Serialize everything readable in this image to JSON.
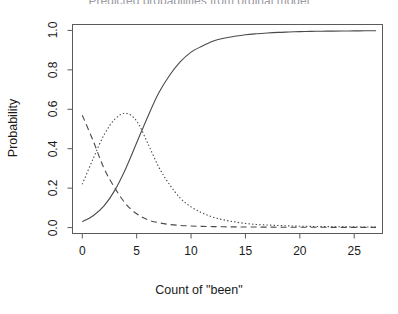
{
  "figure": {
    "title_clipped": "Predicted probabilities from ordinal model",
    "background": "#ffffff",
    "line_color": "#4a4a4a",
    "axis_color": "#5a5a5a"
  },
  "axes": {
    "xlabel": "Count of \"been\"",
    "ylabel": "Probability",
    "xticks": [
      "0",
      "5",
      "10",
      "15",
      "20",
      "25"
    ],
    "yticks": [
      "0.0",
      "0.2",
      "0.4",
      "0.6",
      "0.8",
      "1.0"
    ]
  },
  "chart_data": {
    "type": "line",
    "title": "",
    "xlabel": "Count of \"been\"",
    "ylabel": "Probability",
    "xlim": [
      -0.9,
      27.6
    ],
    "ylim": [
      -0.03,
      1.03
    ],
    "xticks": [
      0,
      5,
      10,
      15,
      20,
      25
    ],
    "yticks": [
      0.0,
      0.2,
      0.4,
      0.6,
      0.8,
      1.0
    ],
    "grid": false,
    "legend": "none",
    "x": [
      0,
      1,
      2,
      3,
      4,
      5,
      6,
      7,
      8,
      9,
      10,
      11,
      12,
      13,
      14,
      15,
      16,
      17,
      18,
      19,
      20,
      21,
      22,
      23,
      24,
      25,
      26,
      27
    ],
    "series": [
      {
        "name": "curve-solid",
        "style": "solid",
        "values": [
          0.03,
          0.06,
          0.11,
          0.19,
          0.3,
          0.43,
          0.56,
          0.68,
          0.77,
          0.84,
          0.89,
          0.92,
          0.945,
          0.96,
          0.97,
          0.978,
          0.983,
          0.987,
          0.99,
          0.992,
          0.994,
          0.995,
          0.996,
          0.9965,
          0.997,
          0.9975,
          0.998,
          0.998
        ]
      },
      {
        "name": "curve-dotted",
        "style": "dotted",
        "values": [
          0.22,
          0.35,
          0.47,
          0.55,
          0.58,
          0.54,
          0.43,
          0.31,
          0.22,
          0.15,
          0.105,
          0.075,
          0.053,
          0.039,
          0.029,
          0.021,
          0.016,
          0.013,
          0.0105,
          0.0085,
          0.007,
          0.006,
          0.005,
          0.0045,
          0.004,
          0.0035,
          0.003,
          0.003
        ]
      },
      {
        "name": "curve-dashed",
        "style": "dashed",
        "values": [
          0.57,
          0.44,
          0.3,
          0.2,
          0.12,
          0.07,
          0.04,
          0.025,
          0.016,
          0.011,
          0.008,
          0.006,
          0.005,
          0.004,
          0.0035,
          0.003,
          0.0026,
          0.0023,
          0.002,
          0.0018,
          0.0016,
          0.0015,
          0.0014,
          0.0013,
          0.0012,
          0.0011,
          0.001,
          0.001
        ]
      }
    ]
  }
}
